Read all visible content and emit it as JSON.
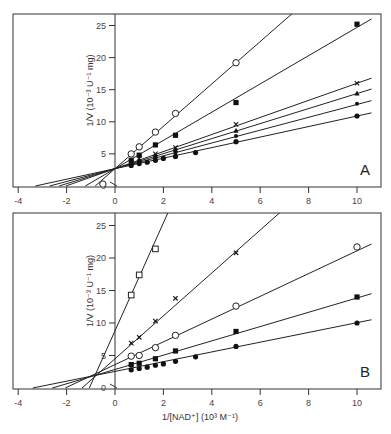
{
  "chart_data": [
    {
      "type": "scatter",
      "panel": "A",
      "title": "",
      "xlabel": "1/[NAD+] (10^3 M^-1)",
      "ylabel": "1/V (10^-3 U^-1 mg)",
      "xlim": [
        -4,
        10.6
      ],
      "ylim": [
        0,
        27
      ],
      "xticks": [
        -4,
        -2,
        0,
        2,
        4,
        6,
        8,
        10
      ],
      "yticks": [
        0,
        5,
        10,
        15,
        20,
        25
      ],
      "grid": false,
      "legend": null,
      "annotation": "A",
      "series": [
        {
          "name": "open circles",
          "marker": "open-circle",
          "points": [
            [
              0.67,
              5.0
            ],
            [
              1.0,
              6.1
            ],
            [
              1.67,
              8.4
            ],
            [
              2.5,
              11.3
            ],
            [
              5.0,
              19.2
            ]
          ],
          "line": {
            "slope": 3.3,
            "intercept": 2.7
          }
        },
        {
          "name": "filled squares",
          "marker": "filled-square",
          "points": [
            [
              0.67,
              4.0
            ],
            [
              1.0,
              4.8
            ],
            [
              1.67,
              6.4
            ],
            [
              2.5,
              7.9
            ],
            [
              5.0,
              13.0
            ],
            [
              10.0,
              25.2
            ]
          ],
          "line": {
            "slope": 2.2,
            "intercept": 2.7
          }
        },
        {
          "name": "crosses",
          "marker": "cross",
          "points": [
            [
              0.67,
              3.7
            ],
            [
              1.0,
              4.3
            ],
            [
              1.67,
              5.0
            ],
            [
              2.5,
              6.0
            ],
            [
              5.0,
              9.6
            ],
            [
              10.0,
              16.0
            ]
          ],
          "line": {
            "slope": 1.33,
            "intercept": 2.7
          }
        },
        {
          "name": "triangles",
          "marker": "filled-triangle",
          "points": [
            [
              0.67,
              3.6
            ],
            [
              1.0,
              4.0
            ],
            [
              1.67,
              4.7
            ],
            [
              2.5,
              5.6
            ],
            [
              5.0,
              8.6
            ],
            [
              10.0,
              14.4
            ]
          ],
          "line": {
            "slope": 1.17,
            "intercept": 2.7
          }
        },
        {
          "name": "small dots",
          "marker": "small-dot",
          "points": [
            [
              0.67,
              3.4
            ],
            [
              1.0,
              3.8
            ],
            [
              1.67,
              4.4
            ],
            [
              2.5,
              5.2
            ],
            [
              5.0,
              7.8
            ],
            [
              10.0,
              12.8
            ]
          ],
          "line": {
            "slope": 1.0,
            "intercept": 2.7
          }
        },
        {
          "name": "filled circles",
          "marker": "filled-circle",
          "points": [
            [
              0.67,
              3.2
            ],
            [
              1.0,
              3.5
            ],
            [
              1.33,
              3.7
            ],
            [
              1.67,
              4.0
            ],
            [
              2.0,
              4.3
            ],
            [
              2.5,
              4.6
            ],
            [
              3.33,
              5.2
            ],
            [
              5.0,
              6.9
            ],
            [
              10.0,
              10.9
            ]
          ],
          "line": {
            "slope": 0.82,
            "intercept": 2.7
          }
        }
      ],
      "extra_marker": {
        "marker": "open-circle",
        "point": [
          -0.5,
          0.3
        ]
      }
    },
    {
      "type": "scatter",
      "panel": "B",
      "title": "",
      "xlabel": "1/[NAD+] (10^3 M^-1)",
      "ylabel": "1/V (10^-3 U^-1 mg)",
      "xlim": [
        -4,
        10.6
      ],
      "ylim": [
        0,
        27
      ],
      "xticks": [
        -4,
        -2,
        0,
        2,
        4,
        6,
        8,
        10
      ],
      "yticks": [
        0,
        5,
        10,
        15,
        20,
        25
      ],
      "grid": false,
      "legend": null,
      "annotation": "B",
      "series": [
        {
          "name": "open squares",
          "marker": "open-square",
          "points": [
            [
              0.67,
              14.3
            ],
            [
              1.0,
              17.4
            ],
            [
              1.67,
              21.4
            ]
          ],
          "line": {
            "slope": 8.3,
            "intercept": 8.8
          }
        },
        {
          "name": "crosses",
          "marker": "cross",
          "points": [
            [
              0.67,
              6.9
            ],
            [
              1.0,
              7.8
            ],
            [
              1.67,
              10.3
            ],
            [
              2.5,
              13.8
            ],
            [
              5.0,
              20.8
            ]
          ],
          "line": {
            "slope": 3.3,
            "intercept": 4.5
          }
        },
        {
          "name": "open circles",
          "marker": "open-circle",
          "points": [
            [
              0.67,
              4.9
            ],
            [
              1.0,
              5.0
            ],
            [
              1.67,
              6.2
            ],
            [
              2.5,
              8.1
            ],
            [
              5.0,
              12.6
            ],
            [
              10.0,
              21.7
            ]
          ],
          "line": {
            "slope": 1.75,
            "intercept": 3.6
          }
        },
        {
          "name": "filled squares",
          "marker": "filled-square",
          "points": [
            [
              0.67,
              3.6
            ],
            [
              1.0,
              3.8
            ],
            [
              1.67,
              4.5
            ],
            [
              2.5,
              5.7
            ],
            [
              5.0,
              8.7
            ],
            [
              10.0,
              14.0
            ]
          ],
          "line": {
            "slope": 1.1,
            "intercept": 2.85
          }
        },
        {
          "name": "filled circles",
          "marker": "filled-circle",
          "points": [
            [
              0.67,
              2.8
            ],
            [
              1.0,
              3.0
            ],
            [
              1.33,
              3.2
            ],
            [
              1.67,
              3.5
            ],
            [
              2.0,
              3.7
            ],
            [
              2.5,
              4.1
            ],
            [
              3.33,
              4.8
            ],
            [
              5.0,
              6.4
            ],
            [
              10.0,
              10.0
            ]
          ],
          "line": {
            "slope": 0.75,
            "intercept": 2.55
          }
        }
      ]
    }
  ],
  "figure": {
    "panels": [
      {
        "letter": "A",
        "ylabel": "1/V (10⁻³ U⁻¹ mg)",
        "xticks": [
          "-4",
          "-2",
          "0",
          "2",
          "4",
          "6",
          "8",
          "10"
        ],
        "yticks": [
          "25",
          "20",
          "15",
          "10",
          "5",
          "0"
        ]
      },
      {
        "letter": "B",
        "ylabel": "1/V (10⁻³ U⁻¹ mg)",
        "xticks": [
          "-4",
          "-2",
          "0",
          "2",
          "4",
          "6",
          "8",
          "10"
        ],
        "yticks": [
          "25",
          "20",
          "15",
          "10",
          "5",
          "0"
        ]
      }
    ],
    "xlabel": "1/[NAD⁺] (10³ M⁻¹)"
  }
}
